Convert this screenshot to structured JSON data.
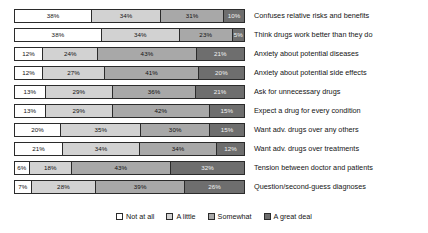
{
  "chart_data": {
    "type": "bar",
    "subtype": "stacked-horizontal-100",
    "title": "",
    "xlabel": "",
    "ylabel": "",
    "xlim": [
      0,
      100
    ],
    "grid": false,
    "legend_position": "bottom-center",
    "value_suffix": "%",
    "categories": [
      "Confuses relative risks and benefits",
      "Think drugs work better than they do",
      "Anxiety about potential diseases",
      "Anxiety about potential side effects",
      "Ask for unnecessary drugs",
      "Expect a drug for every condition",
      "Want adv. drugs over any others",
      "Want adv. drugs over treatments",
      "Tension between doctor and patients",
      "Question/second-guess diagnoses"
    ],
    "series": [
      {
        "name": "Not at all",
        "color": "#ffffff",
        "values": [
          38,
          38,
          12,
          12,
          13,
          13,
          20,
          21,
          6,
          7
        ]
      },
      {
        "name": "A little",
        "color": "#d2d2d2",
        "values": [
          34,
          34,
          24,
          27,
          29,
          29,
          35,
          34,
          18,
          28
        ]
      },
      {
        "name": "Somewhat",
        "color": "#a8a8a8",
        "values": [
          31,
          23,
          43,
          41,
          36,
          42,
          30,
          34,
          43,
          39
        ]
      },
      {
        "name": "A great deal",
        "color": "#6e6e6e",
        "values": [
          10,
          5,
          21,
          20,
          21,
          15,
          15,
          12,
          32,
          26
        ]
      }
    ],
    "labels": [
      [
        "38%",
        "34%",
        "31%",
        "10%"
      ],
      [
        "38%",
        "34%",
        "23%",
        "5%"
      ],
      [
        "12%",
        "24%",
        "43%",
        "21%"
      ],
      [
        "12%",
        "27%",
        "41%",
        "20%"
      ],
      [
        "13%",
        "29%",
        "36%",
        "21%"
      ],
      [
        "13%",
        "29%",
        "42%",
        "15%"
      ],
      [
        "20%",
        "35%",
        "30%",
        "15%"
      ],
      [
        "21%",
        "34%",
        "34%",
        "12%"
      ],
      [
        "6%",
        "18%",
        "43%",
        "32%"
      ],
      [
        "7%",
        "28%",
        "39%",
        "26%"
      ]
    ]
  }
}
